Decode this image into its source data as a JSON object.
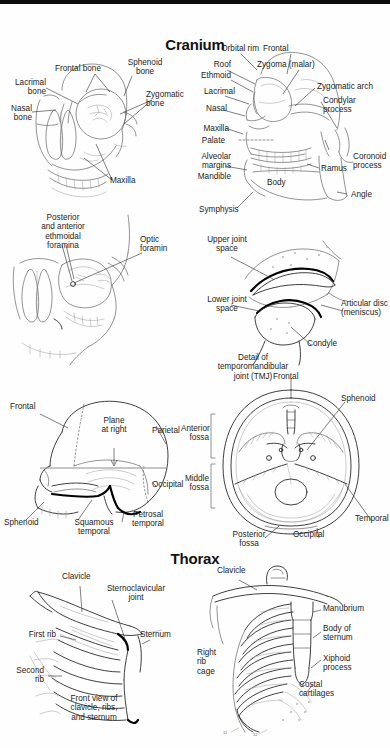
{
  "page": {
    "background": "#fefefe",
    "ink_color": "#2a2a2a"
  },
  "sections": [
    {
      "id": "cranium",
      "title": "Cranium"
    },
    {
      "id": "thorax",
      "title": "Thorax"
    }
  ],
  "panels": {
    "skull_anterior": {
      "name": "Anterior view of skull",
      "labels": [
        "Frontal bone",
        "Sphenoid\nbone",
        "Lacrimal\nbone",
        "Zygomatic\nbone",
        "Nasal\nbone",
        "Maxilla"
      ]
    },
    "skull_lateral": {
      "name": "Lateral view of skull",
      "labels": [
        "Orbital rim",
        "Frontal",
        "Roof",
        "Zygoma (malar)",
        "Ethmoid",
        "Zygomatic arch",
        "Lacrimal",
        "Condylar\nprocess",
        "Nasal",
        "Maxilla",
        "Palate",
        "Alveolar\nmargins",
        "Ramus",
        "Coronoid\nprocess",
        "Mandible",
        "Body",
        "Angle",
        "Symphysis"
      ]
    },
    "orbit_oblique": {
      "name": "Oblique view of orbit and facial skeleton",
      "labels": [
        "Posterior\nand anterior\nethmoidal\nforamina",
        "Optic\nforamin"
      ]
    },
    "tmj_detail": {
      "name": "Temporomandibular joint detail",
      "labels": [
        "Upper joint\nspace",
        "Lower joint\nspace",
        "Articular disc\n(meniscus)",
        "Condyle"
      ],
      "caption": "Detail of\ntemporomandibular\njoint (TMJ)"
    },
    "skull_lateral_plane": {
      "name": "Lateral skull with section plane",
      "labels": [
        "Frontal",
        "Plane\nat right",
        "Parietal",
        "Occipital",
        "Sphenoid",
        "Squamous\ntemporal",
        "Petrosal\ntemporal"
      ]
    },
    "skull_base": {
      "name": "Superior view of cranial base",
      "labels": [
        "Frontal",
        "Sphenoid",
        "Anterior\nfossa",
        "Middle\nfossa",
        "Temporal",
        "Posterior\nfossa",
        "Occipital"
      ]
    },
    "clavicle_sternum": {
      "name": "Front view of clavicle, ribs and sternum",
      "labels": [
        "Clavicle",
        "Sternoclavicular\njoint",
        "First rib",
        "Sternum",
        "Second\nrib"
      ],
      "caption": "Front view of\nclavicle, ribs,\nand sternum"
    },
    "rib_cage": {
      "name": "Right rib cage and sternum",
      "labels": [
        "Clavicle",
        "Manubrium",
        "Body of\nsternum",
        "Right\nrib\ncage",
        "Xiphoid\nprocess",
        "Costal\ncartilages"
      ],
      "rib_numbers": [
        "11",
        "12"
      ]
    }
  }
}
